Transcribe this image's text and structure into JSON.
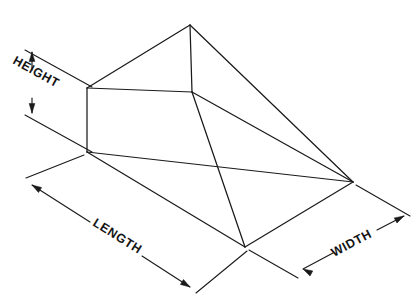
{
  "figure": {
    "background_color": "#ffffff",
    "line_color": "#1a1a1a",
    "text_color": "#141414"
  },
  "dimensions": {
    "height": {
      "label": "HEIGHT",
      "orientation": "vertical",
      "arrow_count": 2
    },
    "length": {
      "label": "LENGTH",
      "orientation": "diagonal-down-right",
      "arrow_count": 2
    },
    "width": {
      "label": "WIDTH",
      "orientation": "diagonal-up-right",
      "arrow_count": 2
    }
  },
  "geometry": {
    "apex_back_top": [
      190,
      25
    ],
    "left_top_corner": [
      87,
      88
    ],
    "right_top_corner": [
      192,
      92
    ],
    "left_base_front": [
      87,
      152
    ],
    "right_base_vertex": [
      353,
      182
    ],
    "front_base_vertex": [
      245,
      247
    ]
  }
}
